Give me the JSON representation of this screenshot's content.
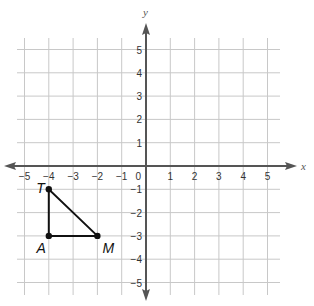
{
  "chart_data": {
    "type": "scatter",
    "title": "",
    "xlabel": "x",
    "ylabel": "y",
    "xlim": [
      -5,
      5
    ],
    "ylim": [
      -5,
      5
    ],
    "grid": true,
    "x_ticks": [
      -5,
      -4,
      -3,
      -2,
      -1,
      1,
      2,
      3,
      4,
      5
    ],
    "y_ticks": [
      5,
      4,
      3,
      2,
      1,
      -1,
      -2,
      -3,
      -4,
      -5
    ],
    "origin_label": "0",
    "polygon": {
      "name": "Triangle TAM",
      "vertices": [
        {
          "label": "T",
          "x": -4,
          "y": -1
        },
        {
          "label": "A",
          "x": -4,
          "y": -3
        },
        {
          "label": "M",
          "x": -2,
          "y": -3
        }
      ],
      "closed": true
    },
    "legend": null
  },
  "colors": {
    "grid": "#c8c8c8",
    "axis": "#555555",
    "polygon": "#111111",
    "text": "#333333"
  }
}
